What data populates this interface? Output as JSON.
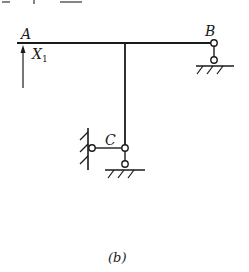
{
  "header": {
    "cutoff_text": "X₁ + ... X₂"
  },
  "diagram": {
    "labels": {
      "A": "A",
      "B": "B",
      "C": "C",
      "X1_main": "X",
      "X1_sub": "1"
    },
    "caption": "(b)",
    "colors": {
      "stroke": "#1a1a1a",
      "background": "#ffffff"
    }
  }
}
